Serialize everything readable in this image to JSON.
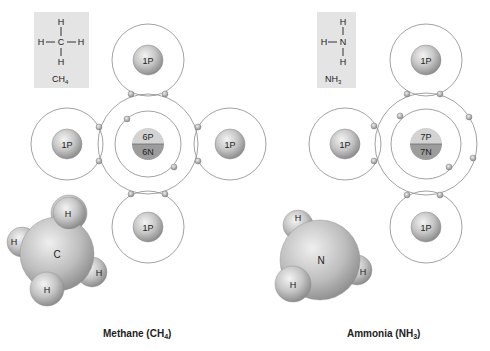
{
  "methane": {
    "formula_box": {
      "top": "H",
      "left": "H",
      "center": "C",
      "right": "H",
      "bottom": "H",
      "formula_main": "CH",
      "formula_sub": "4"
    },
    "central_nucleus": {
      "protons": "6P",
      "neutrons": "6N"
    },
    "hydrogens": [
      {
        "label": "1P"
      },
      {
        "label": "1P"
      },
      {
        "label": "1P"
      },
      {
        "label": "1P"
      }
    ],
    "model": {
      "center": "C",
      "h1": "H",
      "h2": "H",
      "h3": "H",
      "h4": "H"
    },
    "caption_main": "Methane (CH",
    "caption_sub": "4",
    "caption_end": ")"
  },
  "ammonia": {
    "formula_box": {
      "top": "H",
      "left": "H",
      "center": "N",
      "bottom": "H",
      "formula_main": "NH",
      "formula_sub": "3"
    },
    "central_nucleus": {
      "protons": "7P",
      "neutrons": "7N"
    },
    "hydrogens": [
      {
        "label": "1P"
      },
      {
        "label": "1P"
      },
      {
        "label": "1P"
      }
    ],
    "model": {
      "center": "N",
      "h1": "H",
      "h2": "H",
      "h3": "H"
    },
    "caption_main": "Ammonia (NH",
    "caption_sub": "3",
    "caption_end": ")"
  },
  "colors": {
    "box_bg": "#e4e4e4",
    "shell": "#8a8a8a",
    "proton_top": "#d0d0d0",
    "neutron_bottom": "#9a9a9a"
  }
}
